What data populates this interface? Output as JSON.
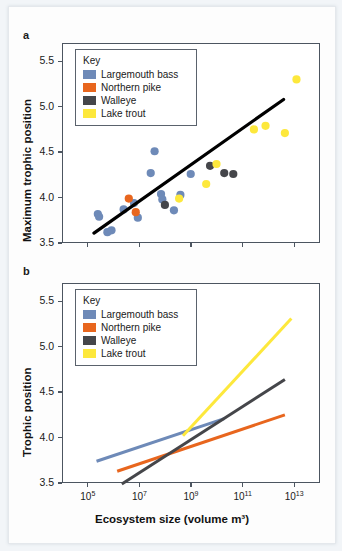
{
  "figure": {
    "panels": [
      {
        "letter": "a",
        "ylabel": "Maximum trophic position",
        "xlabel": "",
        "yticks": [
          "3.5",
          "4.0",
          "4.5",
          "5.0",
          "5.5"
        ],
        "xticks": [
          "10⁵",
          "10⁷",
          "10⁹",
          "10¹¹",
          "10¹³"
        ]
      },
      {
        "letter": "b",
        "ylabel": "Trophic position",
        "xlabel": "Ecosystem size (volume m³)",
        "yticks": [
          "3.5",
          "4.0",
          "4.5",
          "5.0",
          "5.5"
        ],
        "xticks": [
          "10⁵",
          "10⁷",
          "10⁹",
          "10¹¹",
          "10¹³"
        ]
      }
    ]
  },
  "legend": {
    "title": "Key",
    "entries": [
      {
        "label": "Largemouth bass",
        "color": "#6e8ab8"
      },
      {
        "label": "Northern pike",
        "color": "#e8661e"
      },
      {
        "label": "Walleye",
        "color": "#45464a"
      },
      {
        "label": "Lake trout",
        "color": "#fde83c"
      }
    ]
  },
  "chart_data": [
    {
      "type": "scatter",
      "panel": "a",
      "title": "",
      "xlabel": "Ecosystem size (volume m3)",
      "ylabel": "Maximum trophic position",
      "xscale": "log10",
      "xlim": [
        4.0,
        14.0
      ],
      "ylim": [
        3.5,
        5.7
      ],
      "yticks": [
        3.5,
        4.0,
        4.5,
        5.0,
        5.5
      ],
      "xticks": [
        5,
        7,
        9,
        11,
        13
      ],
      "grid": false,
      "legend_position": "top-left",
      "series": [
        {
          "name": "Largemouth bass",
          "color": "#6e8ab8",
          "points": [
            [
              5.35,
              3.83
            ],
            [
              5.4,
              3.8
            ],
            [
              5.72,
              3.63
            ],
            [
              5.88,
              3.65
            ],
            [
              6.35,
              3.88
            ],
            [
              6.75,
              3.95
            ],
            [
              6.9,
              3.79
            ],
            [
              7.55,
              4.52
            ],
            [
              7.4,
              4.28
            ],
            [
              7.8,
              4.05
            ],
            [
              7.85,
              3.99
            ],
            [
              8.3,
              3.87
            ],
            [
              8.95,
              4.27
            ],
            [
              8.55,
              4.04
            ]
          ]
        },
        {
          "name": "Northern pike",
          "color": "#e8661e",
          "points": [
            [
              6.55,
              4.0
            ],
            [
              6.82,
              3.85
            ]
          ]
        },
        {
          "name": "Walleye",
          "color": "#45464a",
          "points": [
            [
              7.95,
              3.93
            ],
            [
              9.7,
              4.36
            ],
            [
              10.25,
              4.28
            ],
            [
              10.6,
              4.27
            ]
          ]
        },
        {
          "name": "Lake trout",
          "color": "#fde83c",
          "points": [
            [
              8.5,
              4.0
            ],
            [
              9.55,
              4.16
            ],
            [
              9.95,
              4.38
            ],
            [
              11.4,
              4.76
            ],
            [
              11.85,
              4.8
            ],
            [
              12.6,
              4.72
            ],
            [
              13.05,
              5.31
            ]
          ]
        }
      ],
      "trendline": {
        "color": "#000000",
        "x_start": 5.2,
        "y_start": 3.62,
        "x_end": 12.55,
        "y_end": 5.09
      }
    },
    {
      "type": "line",
      "panel": "b",
      "title": "",
      "xlabel": "Ecosystem size (volume m3)",
      "ylabel": "Trophic position",
      "xscale": "log10",
      "xlim": [
        4.0,
        14.0
      ],
      "ylim": [
        3.5,
        5.7
      ],
      "yticks": [
        3.5,
        4.0,
        4.5,
        5.0,
        5.5
      ],
      "xticks": [
        5,
        7,
        9,
        11,
        13
      ],
      "grid": false,
      "legend_position": "top-left",
      "series": [
        {
          "name": "Largemouth bass",
          "color": "#6e8ab8",
          "x_start": 5.3,
          "y_start": 3.75,
          "x_end": 10.25,
          "y_end": 4.22
        },
        {
          "name": "Northern pike",
          "color": "#e8661e",
          "x_start": 6.1,
          "y_start": 3.64,
          "x_end": 12.6,
          "y_end": 4.26
        },
        {
          "name": "Walleye",
          "color": "#45464a",
          "x_start": 6.28,
          "y_start": 3.5,
          "x_end": 12.6,
          "y_end": 4.65
        },
        {
          "name": "Lake trout",
          "color": "#fde83c",
          "x_start": 8.65,
          "y_start": 4.03,
          "x_end": 12.85,
          "y_end": 5.32
        }
      ]
    }
  ]
}
